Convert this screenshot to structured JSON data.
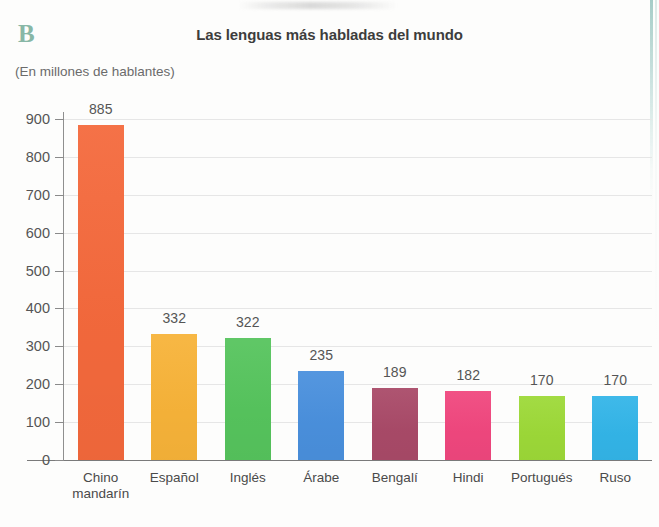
{
  "panel": {
    "letter": "B",
    "letter_color": "#88b7a6"
  },
  "header": {
    "title": "Las lenguas más habladas del mundo",
    "subtitle": "(En millones de hablantes)"
  },
  "chart_data": {
    "type": "bar",
    "title": "Las lenguas más habladas del mundo",
    "subtitle": "(En millones de hablantes)",
    "xlabel": "",
    "ylabel": "",
    "ylim": [
      0,
      900
    ],
    "ytick_step": 100,
    "yticks": [
      "900",
      "800",
      "700",
      "600",
      "500",
      "400",
      "300",
      "200",
      "100",
      "0"
    ],
    "grid": true,
    "legend": "none",
    "categories": [
      "Chino\nmandarín",
      "Español",
      "Inglés",
      "Árabe",
      "Bengalí",
      "Hindi",
      "Portugués",
      "Ruso"
    ],
    "values": [
      885,
      332,
      322,
      235,
      189,
      182,
      170,
      170
    ],
    "value_labels": [
      "885",
      "332",
      "322",
      "235",
      "189",
      "182",
      "170",
      "170"
    ],
    "colors": [
      "#f4693c",
      "#f7b339",
      "#56c45d",
      "#4a90dd",
      "#a94a68",
      "#f0477e",
      "#9dd938",
      "#33b5e8"
    ]
  }
}
